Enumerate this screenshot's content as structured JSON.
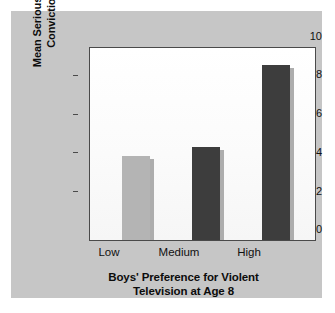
{
  "chart_data": {
    "type": "bar",
    "title": "",
    "categories": [
      "Low",
      "Medium",
      "High"
    ],
    "values": [
      4.4,
      4.85,
      9.1
    ],
    "xlabel_lines": [
      "Boys' Preference for Violent",
      "Television at Age 8"
    ],
    "ylabel_lines": [
      "Mean Seriousness of Criminal",
      "Convictions by Age 30"
    ],
    "ylim": [
      0,
      10
    ],
    "yticks": [
      0,
      2,
      4,
      6,
      8,
      10
    ],
    "ytick_labels": [
      "0",
      "2",
      "4",
      "6",
      "8",
      "10"
    ],
    "grid": false,
    "legend": "none",
    "bar_colors": [
      "#b4b4b4",
      "#3d3d3d",
      "#3d3d3d"
    ],
    "shadow_color": "#adadad",
    "plot_background": "#ffffff",
    "panel_background": "#c6c6c6",
    "axis_color": "#4a4a4a"
  }
}
